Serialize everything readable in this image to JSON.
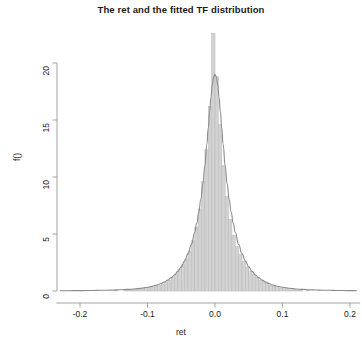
{
  "chart_data": {
    "type": "bar",
    "title": "The ret and the fitted TF distribution",
    "xlabel": "ret",
    "ylabel": "f()",
    "xlim": [
      -0.235,
      0.215
    ],
    "ylim": [
      0,
      20
    ],
    "xticks": [
      -0.2,
      -0.1,
      0.0,
      0.1,
      0.2
    ],
    "xticklabels": [
      "-0.2",
      "-0.1",
      "0.0",
      "0.1",
      "0.2"
    ],
    "yticks": [
      0,
      5,
      10,
      15,
      20
    ],
    "yticklabels": [
      "0",
      "5",
      "10",
      "15",
      "20"
    ],
    "grid": false,
    "legend": null,
    "bin_width": 0.005,
    "bar_color": "#d2d2d2",
    "bar_edge_color": "#b9b9b9",
    "curve_color": "#8a8a8a",
    "axis_color": "#9a9a9a",
    "note": "Histogram of returns with fitted tempered-stable / TF density overlay; central bar exceeds the plotted y-range and is clipped at the panel top.",
    "series": [
      {
        "name": "ret histogram",
        "kind": "histogram",
        "bin_centers": [
          -0.2275,
          -0.2225,
          -0.2175,
          -0.2125,
          -0.2075,
          -0.2025,
          -0.1975,
          -0.1925,
          -0.1875,
          -0.1825,
          -0.1775,
          -0.1725,
          -0.1675,
          -0.1625,
          -0.1575,
          -0.1525,
          -0.1475,
          -0.1425,
          -0.1375,
          -0.1325,
          -0.1275,
          -0.1225,
          -0.1175,
          -0.1125,
          -0.1075,
          -0.1025,
          -0.0975,
          -0.0925,
          -0.0875,
          -0.0825,
          -0.0775,
          -0.0725,
          -0.0675,
          -0.0625,
          -0.0575,
          -0.0525,
          -0.0475,
          -0.0425,
          -0.0375,
          -0.0325,
          -0.0275,
          -0.0225,
          -0.0175,
          -0.0125,
          -0.0075,
          -0.0025,
          0.0025,
          0.0075,
          0.0125,
          0.0175,
          0.0225,
          0.0275,
          0.0325,
          0.0375,
          0.0425,
          0.0475,
          0.0525,
          0.0575,
          0.0625,
          0.0675,
          0.0725,
          0.0775,
          0.0825,
          0.0875,
          0.0925,
          0.0975,
          0.1025,
          0.1075,
          0.1125,
          0.1175,
          0.1225,
          0.1275,
          0.1325,
          0.1375
        ],
        "values": [
          0.0,
          0.0,
          0.0,
          0.0,
          0.0,
          0.0,
          0.0,
          0.0,
          0.0,
          0.0,
          0.0,
          0.0,
          0.0,
          0.0,
          0.0,
          0.0,
          0.05,
          0.0,
          0.0,
          0.05,
          0.05,
          0.1,
          0.1,
          0.15,
          0.2,
          0.2,
          0.3,
          0.35,
          0.45,
          0.5,
          0.6,
          0.75,
          0.95,
          1.2,
          1.5,
          1.9,
          2.3,
          2.8,
          3.5,
          4.4,
          5.6,
          7.2,
          9.6,
          12.4,
          16.2,
          22.6,
          18.8,
          14.6,
          11.0,
          8.3,
          6.3,
          4.9,
          3.9,
          3.2,
          2.6,
          2.1,
          1.75,
          1.45,
          1.2,
          0.95,
          0.8,
          0.65,
          0.5,
          0.4,
          0.3,
          0.25,
          0.2,
          0.15,
          0.1,
          0.1,
          0.05,
          0.05,
          0.0,
          0.05
        ]
      },
      {
        "name": "fitted TF density",
        "kind": "line",
        "x": [
          -0.23,
          -0.22,
          -0.21,
          -0.2,
          -0.19,
          -0.18,
          -0.17,
          -0.16,
          -0.15,
          -0.14,
          -0.13,
          -0.12,
          -0.11,
          -0.1,
          -0.095,
          -0.09,
          -0.085,
          -0.08,
          -0.075,
          -0.07,
          -0.065,
          -0.06,
          -0.055,
          -0.05,
          -0.045,
          -0.04,
          -0.035,
          -0.03,
          -0.027,
          -0.024,
          -0.021,
          -0.018,
          -0.015,
          -0.012,
          -0.01,
          -0.008,
          -0.006,
          -0.004,
          -0.002,
          0.0,
          0.002,
          0.004,
          0.006,
          0.008,
          0.01,
          0.012,
          0.015,
          0.018,
          0.021,
          0.024,
          0.027,
          0.03,
          0.035,
          0.04,
          0.045,
          0.05,
          0.055,
          0.06,
          0.065,
          0.07,
          0.075,
          0.08,
          0.085,
          0.09,
          0.095,
          0.1,
          0.11,
          0.12,
          0.13,
          0.14,
          0.15,
          0.16,
          0.17,
          0.18,
          0.19,
          0.2,
          0.21
        ],
        "y": [
          0.02,
          0.02,
          0.03,
          0.03,
          0.04,
          0.05,
          0.06,
          0.07,
          0.09,
          0.11,
          0.14,
          0.18,
          0.24,
          0.33,
          0.39,
          0.46,
          0.55,
          0.66,
          0.79,
          0.95,
          1.15,
          1.4,
          1.72,
          2.12,
          2.62,
          3.26,
          4.08,
          5.15,
          5.95,
          6.9,
          8.05,
          9.4,
          11.0,
          12.9,
          14.3,
          15.7,
          17.0,
          18.1,
          18.8,
          19.0,
          18.8,
          18.1,
          17.0,
          15.7,
          14.3,
          12.9,
          11.0,
          9.4,
          8.05,
          6.9,
          5.95,
          5.15,
          4.08,
          3.26,
          2.62,
          2.12,
          1.72,
          1.4,
          1.15,
          0.95,
          0.79,
          0.66,
          0.55,
          0.46,
          0.39,
          0.33,
          0.24,
          0.18,
          0.14,
          0.11,
          0.09,
          0.07,
          0.06,
          0.05,
          0.04,
          0.03,
          0.03
        ]
      }
    ]
  }
}
